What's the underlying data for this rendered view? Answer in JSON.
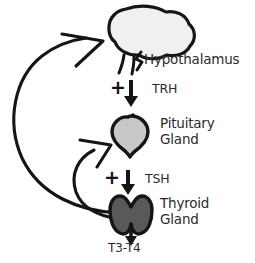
{
  "diagram": {
    "background_color": "#ffffff",
    "ink_color": "#151515",
    "text_color": "#2b2b2b",
    "organs": [
      {
        "id": "hypothalamus",
        "label": "Hypothalamus",
        "fill": "#f0f0f0",
        "stroke": "#151515"
      },
      {
        "id": "pituitary",
        "label_line1": "Pituitary",
        "label_line2": "Gland",
        "fill": "#c8c8c8",
        "stroke": "#151515"
      },
      {
        "id": "thyroid",
        "label_line1": "Thyroid",
        "label_line2": "Gland",
        "fill": "#595959",
        "stroke": "#151515"
      }
    ],
    "hormones": [
      {
        "id": "trh",
        "sign": "+",
        "arrow": "down-arrow-icon",
        "label": "TRH",
        "from": "hypothalamus",
        "to": "pituitary"
      },
      {
        "id": "tsh",
        "sign": "+",
        "arrow": "down-arrow-icon",
        "label": "TSH",
        "from": "pituitary",
        "to": "thyroid"
      },
      {
        "id": "t3t4",
        "arrow": "down-arrow-icon",
        "label": "T3-T4",
        "from": "thyroid",
        "to": "circulation"
      }
    ],
    "feedback": [
      {
        "id": "thyroid-to-hypothalamus",
        "from": "thyroid",
        "to": "hypothalamus",
        "arrow": "curved-feedback-arrow-icon"
      },
      {
        "id": "thyroid-to-pituitary",
        "from": "thyroid",
        "to": "pituitary",
        "arrow": "curved-feedback-arrow-icon"
      }
    ]
  }
}
